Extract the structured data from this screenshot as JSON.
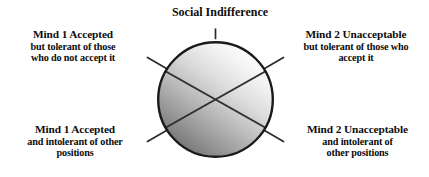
{
  "figure": {
    "title": "Social Indifference",
    "background_color": "#ffffff",
    "text_color": "#0d0d0d"
  },
  "diagram": {
    "type": "quadrant-circle",
    "circle": {
      "center_x": 215.5,
      "center_y": 99.5,
      "radius": 58.5,
      "stroke_color": "#1a1a1a",
      "stroke_width": 2.4,
      "gradient_light": "#fdfdfd",
      "gradient_mid": "#c6c6c6",
      "gradient_dark": "#737373"
    },
    "divider_lines": {
      "count": 2,
      "description": "two diagonal chords forming an X across the circle",
      "stroke_color": "#2b2b2b",
      "stroke_width": 2.0
    },
    "tick_marks": [
      {
        "name": "tick-top",
        "angle_deg": 90,
        "length": 12
      },
      {
        "name": "tick-upper-left",
        "angle_deg": 152,
        "length": 16
      },
      {
        "name": "tick-upper-right",
        "angle_deg": 28,
        "length": 16
      },
      {
        "name": "tick-lower-left",
        "angle_deg": 208,
        "length": 16
      },
      {
        "name": "tick-lower-right",
        "angle_deg": 332,
        "length": 16
      }
    ]
  },
  "labels": {
    "top_left": {
      "line1": "Mind 1 Accepted",
      "line2": "but tolerant of those",
      "line3": "who do not accept it"
    },
    "top_right": {
      "line1": "Mind 2 Unacceptable",
      "line2": "but tolerant of those who",
      "line3": "accept it"
    },
    "bottom_left": {
      "line1": "Mind 1 Accepted",
      "line2": "and intolerant of other",
      "line3": "positions"
    },
    "bottom_right": {
      "line1": "Mind 2 Unacceptable",
      "line2": "and intolerant of",
      "line3": "other positions"
    }
  }
}
